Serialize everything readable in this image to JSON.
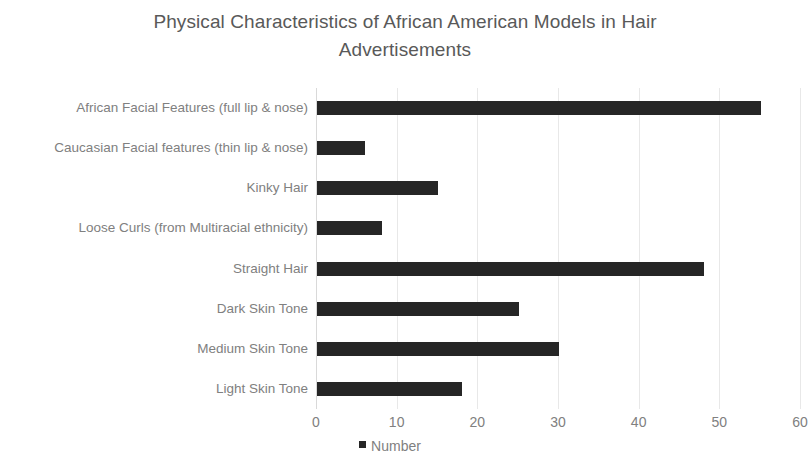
{
  "chart_data": {
    "type": "bar",
    "orientation": "horizontal",
    "title": "Physical Characteristics of African American Models in Hair Advertisements",
    "title_line1": "Physical Characteristics of African American Models in Hair",
    "title_line2": "Advertisements",
    "categories": [
      "African Facial Features (full lip & nose)",
      "Caucasian Facial features (thin lip & nose)",
      "Kinky Hair",
      "Loose Curls (from Multiracial ethnicity)",
      "Straight Hair",
      "Dark Skin Tone",
      "Medium Skin Tone",
      "Light Skin Tone"
    ],
    "values": [
      55,
      6,
      15,
      8,
      48,
      25,
      30,
      18
    ],
    "series": [
      {
        "name": "Number",
        "values": [
          55,
          6,
          15,
          8,
          48,
          25,
          30,
          18
        ]
      }
    ],
    "xlabel": "",
    "ylabel": "",
    "xlim": [
      0,
      60
    ],
    "xticks": [
      "0",
      "10",
      "20",
      "30",
      "40",
      "50",
      "60"
    ],
    "xtick_values": [
      0,
      10,
      20,
      30,
      40,
      50,
      60
    ],
    "grid": "vertical",
    "legend": {
      "position": "bottom",
      "entries": [
        "Number"
      ]
    },
    "colors": {
      "bar": "#262626",
      "text": "#808080",
      "title_text": "#595959",
      "gridline": "#e8e8e8",
      "axis": "#d9d9d9",
      "background": "#ffffff"
    }
  }
}
